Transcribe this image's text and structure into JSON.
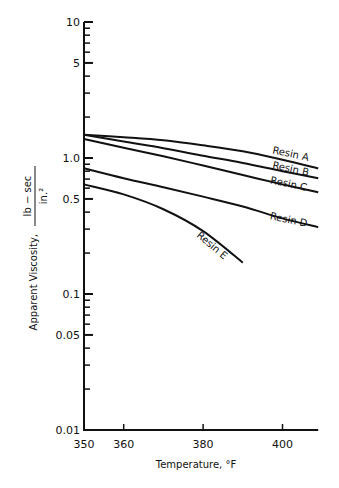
{
  "chart_data": {
    "type": "line",
    "title": "",
    "xlabel": "Temperature, °F",
    "ylabel": "Apparent Viscosity, lb−sec / in.²",
    "ylabel_prefix": "Apparent Viscosity,",
    "ylabel_unit_num": "lb − sec",
    "ylabel_unit_den": "in.²",
    "xlim": [
      350,
      409
    ],
    "ylim": [
      0.01,
      10
    ],
    "yscale": "log",
    "grid": false,
    "legend": "inline labels at line ends",
    "x_ticks": [
      350,
      360,
      380,
      400
    ],
    "x_tick_labels": [
      "350",
      "360",
      "380",
      "400"
    ],
    "y_ticks": [
      10,
      5,
      1.0,
      0.5,
      0.1,
      0.05,
      0.01
    ],
    "y_tick_labels": [
      "10",
      "5",
      "1.0",
      "0.5",
      "0.1",
      "0.05",
      "0.01"
    ],
    "series": [
      {
        "name": "Resin A",
        "x": [
          350,
          360,
          370,
          380,
          390,
          400,
          409
        ],
        "values": [
          1.48,
          1.42,
          1.35,
          1.24,
          1.12,
          0.97,
          0.84
        ]
      },
      {
        "name": "Resin B",
        "x": [
          350,
          360,
          370,
          380,
          390,
          400,
          409
        ],
        "values": [
          1.48,
          1.32,
          1.18,
          1.04,
          0.92,
          0.8,
          0.71
        ]
      },
      {
        "name": "Resin C",
        "x": [
          350,
          360,
          370,
          380,
          390,
          400,
          409
        ],
        "values": [
          1.38,
          1.19,
          1.03,
          0.88,
          0.75,
          0.64,
          0.56
        ]
      },
      {
        "name": "Resin D",
        "x": [
          350,
          360,
          370,
          380,
          390,
          400,
          409
        ],
        "values": [
          0.84,
          0.71,
          0.61,
          0.52,
          0.44,
          0.36,
          0.31
        ]
      },
      {
        "name": "Resin E",
        "x": [
          350,
          360,
          370,
          380,
          390
        ],
        "values": [
          0.64,
          0.54,
          0.42,
          0.29,
          0.17
        ]
      }
    ]
  }
}
